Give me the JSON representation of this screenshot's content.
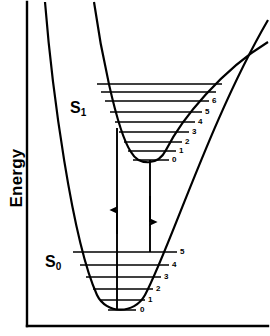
{
  "figure": {
    "type": "potential-energy-diagram",
    "axes": {
      "ylabel": "Energy",
      "xlabel": "",
      "frame": "left-and-bottom"
    },
    "states": [
      {
        "id": "S1",
        "label": "S",
        "sub": "1",
        "label_full": "S1"
      },
      {
        "id": "S0",
        "label": "S",
        "sub": "0",
        "label_full": "S0"
      }
    ],
    "s1": {
      "name": "S1",
      "label_x": 70,
      "label_y": 99,
      "levels": [
        {
          "v": "0",
          "y": 160,
          "x1": 133,
          "x2": 169,
          "label_x": 172,
          "label_y": 156
        },
        {
          "v": "1",
          "y": 151,
          "x1": 128,
          "x2": 176,
          "label_x": 179,
          "label_y": 147
        },
        {
          "v": "2",
          "y": 142,
          "x1": 124,
          "x2": 182,
          "label_x": 185,
          "label_y": 138
        },
        {
          "v": "3",
          "y": 132,
          "x1": 119,
          "x2": 189,
          "label_x": 192,
          "label_y": 128
        },
        {
          "v": "4",
          "y": 122,
          "x1": 115,
          "x2": 195,
          "label_x": 198,
          "label_y": 118
        },
        {
          "v": "5",
          "y": 112,
          "x1": 110,
          "x2": 202,
          "label_x": 205,
          "label_y": 108
        },
        {
          "v": "6",
          "y": 101,
          "x1": 105,
          "x2": 209,
          "label_x": 212,
          "label_y": 97
        }
      ],
      "extra_levels": [
        {
          "y": 92,
          "x1": 101,
          "x2": 215
        },
        {
          "y": 85,
          "x1": 98,
          "x2": 220
        }
      ]
    },
    "s0": {
      "name": "S0",
      "label_x": 45,
      "label_y": 253,
      "levels": [
        {
          "v": "0",
          "y": 310,
          "x1": 108,
          "x2": 136,
          "label_x": 140,
          "label_y": 306
        },
        {
          "v": "1",
          "y": 300,
          "x1": 100,
          "x2": 145,
          "label_x": 148,
          "label_y": 296
        },
        {
          "v": "2",
          "y": 289,
          "x1": 93,
          "x2": 153,
          "label_x": 156,
          "label_y": 285
        },
        {
          "v": "3",
          "y": 277,
          "x1": 86,
          "x2": 161,
          "label_x": 164,
          "label_y": 273
        },
        {
          "v": "4",
          "y": 265,
          "x1": 80,
          "x2": 169,
          "label_x": 172,
          "label_y": 261
        },
        {
          "v": "5",
          "y": 252,
          "x1": 73,
          "x2": 177,
          "label_x": 180,
          "label_y": 248
        }
      ]
    },
    "transitions": [
      {
        "id": "absorption",
        "direction": "up",
        "x": 117,
        "from_y": 310,
        "to_y": 128
      },
      {
        "id": "emission",
        "direction": "down",
        "x": 150,
        "from_y": 160,
        "to_y": 252
      }
    ],
    "colors": {
      "ink": "#000000",
      "background": "#ffffff"
    }
  }
}
